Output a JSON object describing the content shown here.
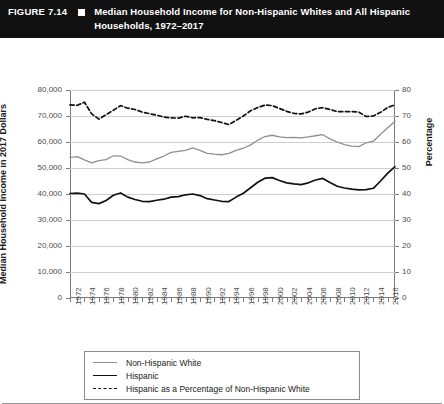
{
  "header": {
    "figure_number": "FIGURE 7.14",
    "bullet_icon": "square-bullet-icon",
    "title": "Median Household Income for Non-Hispanic Whites and All Hispanic Households, 1972–2017"
  },
  "legend": {
    "items": [
      {
        "label": "Non-Hispanic White",
        "style": "solid",
        "color": "#8f8f8f",
        "icon": "line-swatch-icon"
      },
      {
        "label": "Hispanic",
        "style": "solid",
        "color": "#111111",
        "icon": "line-swatch-icon"
      },
      {
        "label": "Hispanic as a Percentage of Non-Hispanic White",
        "style": "dashed",
        "color": "#111111",
        "icon": "dashed-line-swatch-icon"
      }
    ]
  },
  "chart_data": {
    "type": "line",
    "title": "Median Household Income for Non-Hispanic Whites and All Hispanic Households, 1972–2017",
    "xlabel": "",
    "ylabel": "Median Household Income in 2017 Dollars",
    "y2label": "Percentage",
    "ylim": [
      0,
      80000
    ],
    "y2lim": [
      0,
      80
    ],
    "yticks": [
      0,
      10000,
      20000,
      30000,
      40000,
      50000,
      60000,
      70000,
      80000
    ],
    "ytick_labels": [
      "0",
      "10,000",
      "20,000",
      "30,000",
      "40,000",
      "50,000",
      "60,000",
      "70,000",
      "80,000"
    ],
    "y2ticks": [
      0,
      10,
      20,
      30,
      40,
      50,
      60,
      70,
      80
    ],
    "y2tick_labels": [
      "0",
      "10",
      "20",
      "30",
      "40",
      "50",
      "60",
      "70",
      "80"
    ],
    "grid": true,
    "legend_position": "below-plot",
    "xlim": [
      1972,
      2017
    ],
    "x": [
      1972,
      1973,
      1974,
      1975,
      1976,
      1977,
      1978,
      1979,
      1980,
      1981,
      1982,
      1983,
      1984,
      1985,
      1986,
      1987,
      1988,
      1989,
      1990,
      1991,
      1992,
      1993,
      1994,
      1995,
      1996,
      1997,
      1998,
      1999,
      2000,
      2001,
      2002,
      2003,
      2004,
      2005,
      2006,
      2007,
      2008,
      2009,
      2010,
      2011,
      2012,
      2013,
      2014,
      2015,
      2016,
      2017
    ],
    "xtick_labels": [
      "1972",
      "1974",
      "1976",
      "1978",
      "1980",
      "1982",
      "1984",
      "1986",
      "1988",
      "1990",
      "1992",
      "1994",
      "1996",
      "1998",
      "2000",
      "2002",
      "2004",
      "2006",
      "2008",
      "2010",
      "2012",
      "2014",
      "2016"
    ],
    "xtick_label_step": 2,
    "series": [
      {
        "name": "Non-Hispanic White",
        "axis": "left",
        "color": "#8f8f8f",
        "style": "solid",
        "values": [
          54100,
          54400,
          53100,
          52000,
          52800,
          53200,
          54700,
          54600,
          53200,
          52300,
          52000,
          52300,
          53500,
          54600,
          56000,
          56400,
          56800,
          57700,
          56800,
          55600,
          55300,
          55100,
          55600,
          56800,
          57600,
          58900,
          60700,
          62100,
          62600,
          62000,
          61700,
          61800,
          61600,
          62000,
          62400,
          62800,
          61200,
          60000,
          59000,
          58400,
          58200,
          59700,
          60300,
          63000,
          65500,
          68000
        ]
      },
      {
        "name": "Hispanic",
        "axis": "left",
        "color": "#111111",
        "style": "solid",
        "values": [
          40200,
          40300,
          40000,
          36800,
          36300,
          37500,
          39500,
          40400,
          38800,
          37900,
          37200,
          37100,
          37600,
          38000,
          38800,
          39000,
          39700,
          40000,
          39400,
          38200,
          37700,
          37200,
          37100,
          38800,
          40300,
          42400,
          44500,
          46100,
          46300,
          45200,
          44300,
          43900,
          43600,
          44300,
          45400,
          46000,
          44400,
          43000,
          42300,
          41900,
          41600,
          41700,
          42200,
          45000,
          48000,
          50500
        ]
      },
      {
        "name": "Hispanic as a Percentage of Non-Hispanic White",
        "axis": "right",
        "color": "#111111",
        "style": "dashed",
        "values": [
          74.3,
          74.1,
          75.3,
          70.8,
          68.8,
          70.5,
          72.2,
          74.0,
          73.0,
          72.5,
          71.5,
          70.9,
          70.3,
          69.6,
          69.3,
          69.2,
          69.9,
          69.3,
          69.4,
          68.7,
          68.2,
          67.5,
          66.7,
          68.3,
          70.0,
          72.0,
          73.3,
          74.2,
          74.0,
          72.9,
          71.8,
          71.0,
          70.8,
          71.5,
          72.8,
          73.2,
          72.5,
          71.7,
          71.7,
          71.7,
          71.5,
          69.8,
          70.0,
          71.4,
          73.3,
          74.3
        ]
      }
    ]
  }
}
